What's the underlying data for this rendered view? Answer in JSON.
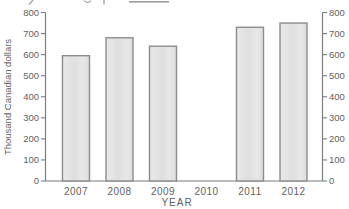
{
  "chart_data": {
    "type": "bar",
    "categories": [
      "2007",
      "2008",
      "2009",
      "2010",
      "2011",
      "2012"
    ],
    "values": [
      595,
      680,
      640,
      null,
      730,
      750
    ],
    "title": "",
    "xlabel": "YEAR",
    "ylabel": "Thousand Canadian dollars",
    "ylim": [
      0,
      800
    ],
    "yticks": [
      0,
      100,
      200,
      300,
      400,
      500,
      600,
      700,
      800
    ],
    "ytick_step": 100,
    "grid": false,
    "legend": null,
    "right_axis_mirrored": true,
    "missing_categories": [
      "2010"
    ]
  },
  "colors": {
    "background": "#ffffff",
    "bar_fill": "#e3e3e3",
    "bar_fill_light": "#eaeaea",
    "bar_border": "#8c8c8c",
    "axis": "#7d7d7d",
    "text": "#5f5f5f",
    "scan_artifact": "#9b9b9b"
  }
}
